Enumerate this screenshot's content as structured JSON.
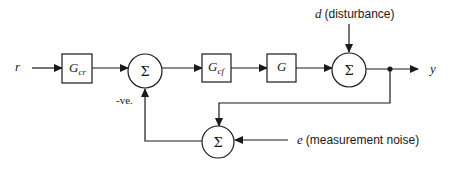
{
  "diagram": {
    "type": "block-diagram",
    "signals": {
      "reference": "r",
      "output": "y",
      "disturbance_symbol": "d",
      "disturbance_label": "(disturbance)",
      "noise_symbol": "e",
      "noise_label": "(measurement noise)",
      "feedback_sign": "-ve."
    },
    "blocks": [
      {
        "id": "Gcr",
        "label": "G",
        "sub": "cr"
      },
      {
        "id": "Gcf",
        "label": "G",
        "sub": "cf"
      },
      {
        "id": "G",
        "label": "G",
        "sub": ""
      }
    ],
    "summing_junctions": [
      {
        "id": "sum1",
        "symbol": "Σ"
      },
      {
        "id": "sum2",
        "symbol": "Σ"
      },
      {
        "id": "sum3",
        "symbol": "Σ"
      }
    ]
  }
}
